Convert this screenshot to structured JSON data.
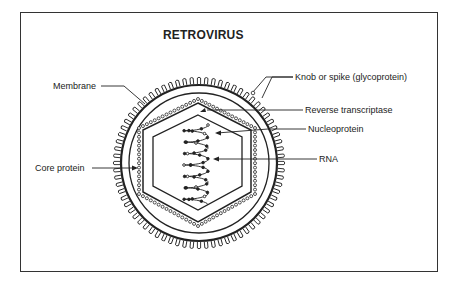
{
  "title": "RETROVIRUS",
  "labels": {
    "knob": "Knob or spike (glycoprotein)",
    "membrane": "Membrane",
    "reverse_transcriptase": "Reverse transcriptase",
    "nucleoprotein": "Nucleoprotein",
    "core_protein": "Core protein",
    "rna": "RNA"
  },
  "colors": {
    "ink": "#222222",
    "background": "#ffffff"
  }
}
